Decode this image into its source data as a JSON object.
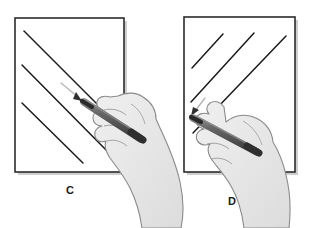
{
  "figure": {
    "background_color": "#ffffff",
    "panel_fill": "#ffffff",
    "panel_border_color": "#2b2b2b",
    "stroke_line_color": "#1a1a1a",
    "pen_body_color": "#5d5d5d",
    "pen_dark_color": "#3a3a3a",
    "hand_fill_color": "#e6e6e6",
    "hand_outline_color": "#8a8a8a",
    "arrow_color": "#b8b8b8",
    "shadow_color": "#cfcfcf"
  },
  "panels": [
    {
      "id": "panel-c",
      "label": "C",
      "label_x": 70,
      "label_y": 194,
      "frame": {
        "x": 15,
        "y": 18,
        "width": 109,
        "height": 154
      },
      "stroke_direction": "down-right",
      "strokes_count": 3,
      "strokes": [
        {
          "x1": 22,
          "y1": 103,
          "x2": 83,
          "y2": 163
        },
        {
          "x1": 22,
          "y1": 65,
          "x2": 113,
          "y2": 157
        },
        {
          "x1": 24,
          "y1": 31,
          "x2": 112,
          "y2": 119
        }
      ],
      "guide_arrow": {
        "x1": 62,
        "y1": 84,
        "x2": 80,
        "y2": 99,
        "label": "direction-arrow"
      },
      "pen": {
        "tip_x": 82,
        "tip_y": 101,
        "end_x": 141,
        "end_y": 139
      },
      "hand_side": "right"
    },
    {
      "id": "panel-d",
      "label": "D",
      "label_x": 232,
      "label_y": 205,
      "frame": {
        "x": 184,
        "y": 17,
        "width": 111,
        "height": 155
      },
      "stroke_direction": "up-right",
      "strokes_count": 3,
      "strokes": [
        {
          "x1": 192,
          "y1": 68,
          "x2": 223,
          "y2": 34
        },
        {
          "x1": 191,
          "y1": 102,
          "x2": 254,
          "y2": 33
        },
        {
          "x1": 193,
          "y1": 133,
          "x2": 286,
          "y2": 36
        }
      ],
      "guide_arrow": {
        "x1": 204,
        "y1": 99,
        "x2": 192,
        "y2": 114,
        "label": "direction-arrow"
      },
      "pen": {
        "tip_x": 191,
        "tip_y": 117,
        "end_x": 257,
        "end_y": 152
      },
      "hand_side": "bottom"
    }
  ]
}
